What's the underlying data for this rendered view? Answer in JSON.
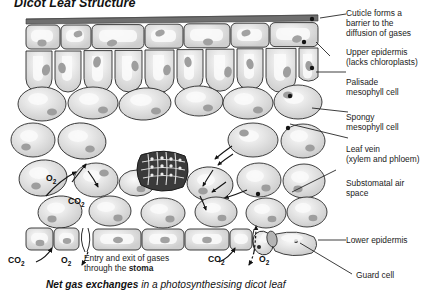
{
  "title": "Dicot Leaf Structure",
  "caption": {
    "bold": "Net gas exchanges",
    "rest": " in a photosynthesising dicot leaf"
  },
  "labels": [
    {
      "name": "cuticle",
      "text": "Cuticle forms a\nbarrier to the\ndiffusion of gases"
    },
    {
      "name": "upper-epidermis",
      "text": "Upper epidermis\n(lacks chloroplasts)"
    },
    {
      "name": "palisade-mesophyll",
      "text": "Palisade\nmesophyll cell"
    },
    {
      "name": "spongy-mesophyll",
      "text": "Spongy\nmesophyll cell"
    },
    {
      "name": "leaf-vein",
      "text": "Leaf vein\n(xylem and phloem)"
    },
    {
      "name": "substomatal-air",
      "text": "Substomatal air\nspace"
    },
    {
      "name": "lower-epidermis",
      "text": "Lower epidermis"
    },
    {
      "name": "guard-cell",
      "text": "Guard cell"
    }
  ],
  "gases": {
    "internal_o2": "O",
    "internal_co2": "CO",
    "left_co2": "CO",
    "left_o2": "O",
    "right_co2": "CO",
    "right_o2": "O",
    "sub_two": "2"
  },
  "stoma_note": {
    "line1": "Entry and exit of gases",
    "line2_pre": "through the ",
    "line2_bold": "stoma"
  },
  "colors": {
    "cuticle": "#6d6d6d",
    "cell_outline": "#2b2b2b",
    "cell_fill": "#d9d9d9",
    "cell_highlight": "#f3f3f3",
    "chloroplast": "#9d9d9d",
    "vein_dark": "#2a2a2a",
    "text": "#1b1b1b",
    "background": "#ffffff"
  }
}
